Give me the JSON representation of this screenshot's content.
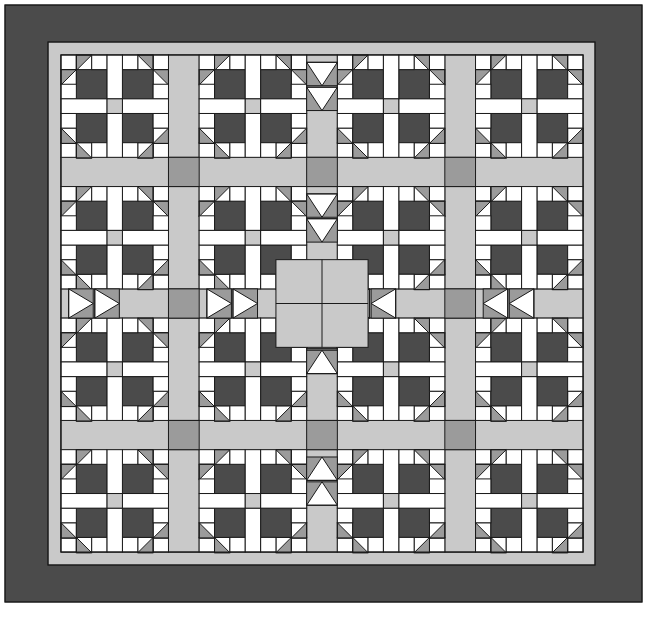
{
  "page": {
    "kind": "quilt-block-diagram",
    "width": 647,
    "height": 627,
    "background": "#ffffff"
  },
  "palette": {
    "dark": "#4b4b4b",
    "medium": "#9b9b9b",
    "light": "#c9c9c9",
    "white": "#ffffff",
    "outline": "#1a1a1a",
    "page_background": "#ffffff"
  },
  "geometry": {
    "outer_border": {
      "x": 5,
      "y": 5,
      "width": 637,
      "height": 597,
      "thickness": 43,
      "color_key": "dark"
    },
    "inner_border": {
      "x": 48,
      "y": 42,
      "width": 547,
      "height": 523,
      "thickness": 13,
      "color_key": "light"
    },
    "field": {
      "x": 61,
      "y": 55,
      "width": 522,
      "height": 497
    },
    "block_grid": {
      "columns": 4,
      "rows": 4
    },
    "unit": 29.0,
    "block_units": 7,
    "sash_units": 2
  },
  "blocks": {
    "name": "Bear's Paw",
    "description": "Four-by-four set of Bear's Paw blocks with flying-geese sashing",
    "paw_triangle_color_key": "medium",
    "paw_square_color_key": "dark",
    "corner_square_color_key": "dark",
    "center_square_color_key": "light",
    "bar_color_key": "white"
  },
  "sashing": {
    "color_key": "light",
    "geese_triangle_color_key": "medium",
    "geese_ground_color_key": "white",
    "post_color_key": "medium",
    "center_medallion_color_key": "light"
  },
  "legend": {
    "swatches": [
      {
        "label": "Dark",
        "color_key": "dark"
      },
      {
        "label": "Medium",
        "color_key": "medium"
      },
      {
        "label": "Light",
        "color_key": "light"
      },
      {
        "label": "White",
        "color_key": "white"
      }
    ]
  },
  "caption": {
    "text": ""
  }
}
